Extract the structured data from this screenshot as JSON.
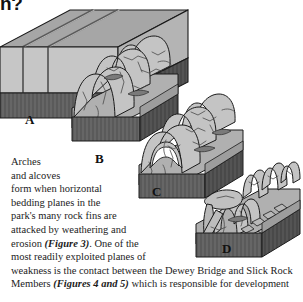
{
  "page": {
    "heading_fragment": "n?",
    "background_color": "#ffffff",
    "text_color": "#1c1c1c"
  },
  "figure": {
    "name": "arch-formation-block-diagram",
    "colors": {
      "top_face": "#a6a6a6",
      "front_face": "#c6c6c6",
      "side_face": "#b4b4b4",
      "base_dark": "#666666",
      "base_dark_side": "#545454",
      "outline": "#1a1a1a",
      "detail_line": "#4a4a4a"
    },
    "stages": [
      {
        "id": "A",
        "label": "A",
        "caption": "Intact jointed rock fins"
      },
      {
        "id": "B",
        "label": "B",
        "caption": "Fins rounded by weathering"
      },
      {
        "id": "C",
        "label": "C",
        "caption": "Arch formed through fin"
      },
      {
        "id": "D",
        "label": "D",
        "caption": "Collapsed arch and remnant pinnacles"
      }
    ]
  },
  "body": {
    "lines": [
      [
        {
          "t": "Arches"
        }
      ],
      [
        {
          "t": "and alcoves"
        }
      ],
      [
        {
          "t": "form when horizontal"
        }
      ],
      [
        {
          "t": "bedding planes in the"
        }
      ],
      [
        {
          "t": "park's many rock fins are"
        }
      ],
      [
        {
          "t": "attacked by weathering and"
        }
      ],
      [
        {
          "t": "erosion "
        },
        {
          "t": "(Figure 3)",
          "cite": true
        },
        {
          "t": ". One of the"
        }
      ],
      [
        {
          "t": "most readily exploited planes of"
        }
      ],
      [
        {
          "t": "weakness is the contact between the Dewey Bridge and Slick Rock"
        }
      ],
      [
        {
          "t": "Members "
        },
        {
          "t": "(Figures 4 and 5)",
          "cite": true
        },
        {
          "t": " which is responsible for development"
        }
      ]
    ]
  }
}
